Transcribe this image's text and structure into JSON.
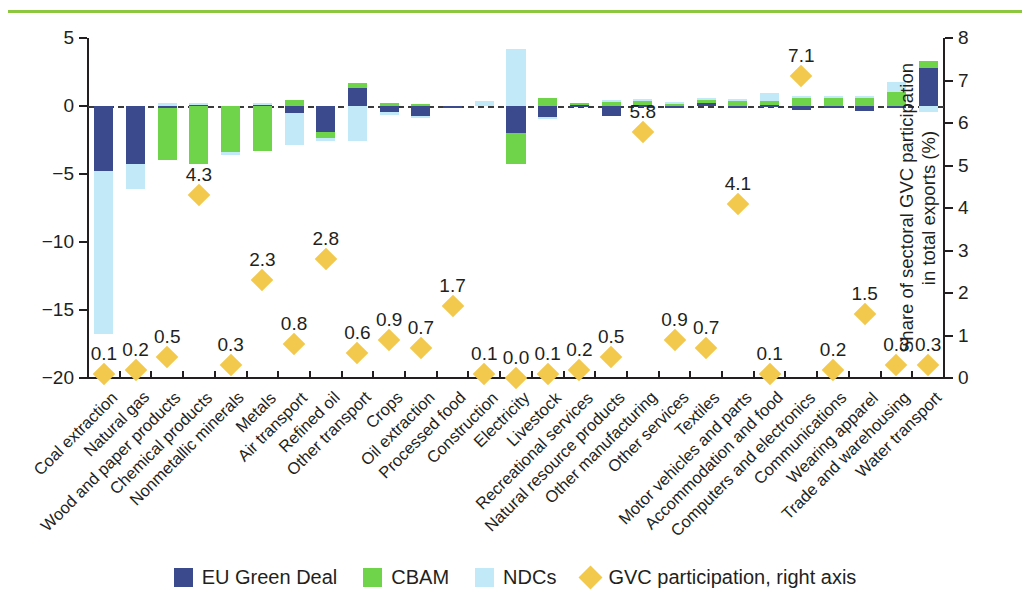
{
  "chart_data": {
    "type": "bar",
    "title": "",
    "subtitle": "",
    "ylabel": "Change in GVC participation (%)",
    "ylabel_right": "Share of sectoral GVC participation in total exports (%)",
    "xlabel": "",
    "ylim": [
      -20,
      5
    ],
    "ylim_right": [
      0,
      8
    ],
    "yticks": [
      5,
      0,
      -5,
      -10,
      -15,
      -20
    ],
    "yticks_right": [
      8,
      7,
      6,
      5,
      4,
      3,
      2,
      1,
      0
    ],
    "grid": false,
    "zero_reference_line": true,
    "legend_position": "bottom",
    "stacked": true,
    "colors": {
      "eu_green_deal": "#3b4a8c",
      "cbam": "#6fd44a",
      "ndcs": "#c2e9f7",
      "gvc_participation": "#f2c94c",
      "top_rule": "#8dc63f",
      "axis": "#231f20"
    },
    "categories": [
      "Coal extraction",
      "Natural gas",
      "Wood and paper products",
      "Chemical products",
      "Nonmetallic minerals",
      "Metals",
      "Air transport",
      "Refined oil",
      "Other transport",
      "Crops",
      "Oil extraction",
      "Processed food",
      "Construction",
      "Electricity",
      "Livestock",
      "Recreational services",
      "Natural resource products",
      "Other manufacturing",
      "Other services",
      "Textiles",
      "Motor vehicles and parts",
      "Accommodation and food",
      "Computers and electronics",
      "Communications",
      "Wearing apparel",
      "Trade and warehousing",
      "Water transport"
    ],
    "series": [
      {
        "name": "EU Green Deal",
        "color": "#3b4a8c",
        "values": [
          -4.8,
          -4.3,
          -0.15,
          0.15,
          0.0,
          0.1,
          -0.5,
          -1.9,
          1.3,
          -0.45,
          -0.7,
          -0.1,
          0.0,
          -2.0,
          -0.8,
          0.1,
          -0.7,
          0.1,
          -0.15,
          0.25,
          -0.15,
          0.05,
          -0.3,
          -0.15,
          -0.35,
          -0.1,
          2.8
        ]
      },
      {
        "name": "CBAM",
        "color": "#6fd44a",
        "values": [
          0.0,
          0.0,
          -3.85,
          -4.25,
          -3.35,
          -3.3,
          0.45,
          -0.45,
          0.4,
          0.25,
          0.15,
          0.0,
          0.0,
          -2.3,
          0.6,
          0.15,
          0.35,
          0.35,
          0.2,
          0.3,
          0.4,
          0.35,
          0.65,
          0.7,
          0.65,
          1.0,
          0.5
        ]
      },
      {
        "name": "NDCs",
        "color": "#c2e9f7",
        "values": [
          -12.0,
          -1.8,
          0.2,
          0.1,
          -0.25,
          0.15,
          -2.4,
          -0.25,
          -2.6,
          -0.2,
          -0.1,
          0.0,
          0.35,
          4.2,
          -0.1,
          0.0,
          0.1,
          0.1,
          0.1,
          0.05,
          0.1,
          0.55,
          0.1,
          0.05,
          0.1,
          0.8,
          -0.45
        ]
      }
    ],
    "overlay_series": {
      "name": "GVC participation, right axis",
      "marker": "diamond",
      "color": "#f2c94c",
      "axis": "right",
      "values": [
        0.1,
        0.2,
        0.5,
        4.3,
        0.3,
        2.3,
        0.8,
        2.8,
        0.6,
        0.9,
        0.7,
        1.7,
        0.1,
        0.0,
        0.1,
        0.2,
        0.5,
        5.8,
        0.9,
        0.7,
        4.1,
        0.1,
        7.1,
        0.2,
        1.5,
        0.3,
        0.3
      ],
      "labels": [
        "0.1",
        "0.2",
        "0.5",
        "4.3",
        "0.3",
        "2.3",
        "0.8",
        "2.8",
        "0.6",
        "0.9",
        "0.7",
        "1.7",
        "0.1",
        "0.0",
        "0.1",
        "0.2",
        "0.5",
        "5.8",
        "0.9",
        "0.7",
        "4.1",
        "0.1",
        "7.1",
        "0.2",
        "1.5",
        "0.3",
        "0.3"
      ]
    },
    "legend": [
      {
        "label": "EU Green Deal",
        "color": "#3b4a8c",
        "marker": "square"
      },
      {
        "label": "CBAM",
        "color": "#6fd44a",
        "marker": "square"
      },
      {
        "label": "NDCs",
        "color": "#c2e9f7",
        "marker": "square"
      },
      {
        "label": "GVC participation, right axis",
        "color": "#f2c94c",
        "marker": "diamond"
      }
    ]
  }
}
